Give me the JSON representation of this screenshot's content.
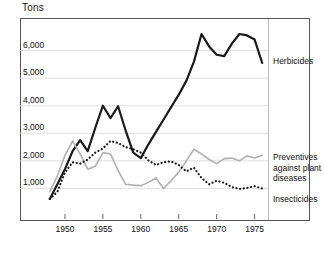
{
  "chart_data": {
    "type": "line",
    "title": "",
    "xlabel": "",
    "ylabel": "Tons",
    "ylim": [
      0,
      7000
    ],
    "xlim": [
      1947.5,
      1976.5
    ],
    "grid": true,
    "grid_axis": "y",
    "legend_position": "right-inline",
    "ytick_labels": [
      "6,000",
      "5,000",
      "4,000",
      "3,000",
      "2,000",
      "1,000"
    ],
    "ytick_values": [
      6000,
      5000,
      4000,
      3000,
      2000,
      1000
    ],
    "xtick_labels": [
      "1950",
      "1955",
      "1960",
      "1965",
      "1970",
      "1975"
    ],
    "xtick_values": [
      1950,
      1955,
      1960,
      1965,
      1970,
      1975
    ],
    "x": [
      1948,
      1949,
      1950,
      1951,
      1952,
      1953,
      1954,
      1955,
      1956,
      1957,
      1958,
      1959,
      1960,
      1961,
      1962,
      1963,
      1964,
      1965,
      1966,
      1967,
      1968,
      1969,
      1970,
      1971,
      1972,
      1973,
      1974,
      1975,
      1976
    ],
    "series": [
      {
        "name": "Herbicides",
        "style": "solid",
        "color": "#1a1a1a",
        "width": 2.2,
        "values": [
          620,
          1150,
          1700,
          2350,
          2750,
          2350,
          3200,
          4000,
          3550,
          3980,
          3100,
          2300,
          2100,
          2600,
          3050,
          3500,
          3950,
          4400,
          4900,
          5600,
          6600,
          6150,
          5850,
          5800,
          6250,
          6600,
          6550,
          6400,
          5550
        ]
      },
      {
        "name": "Preventives against plant diseases",
        "style": "solid",
        "color": "#b0b0b0",
        "width": 1.6,
        "values": [
          880,
          1450,
          2200,
          2720,
          2250,
          1700,
          1800,
          2300,
          2250,
          1650,
          1150,
          1120,
          1100,
          1220,
          1380,
          1000,
          1280,
          1600,
          2000,
          2420,
          2250,
          2050,
          1900,
          2080,
          2100,
          2000,
          2180,
          2100,
          2200
        ]
      },
      {
        "name": "Insecticides",
        "style": "dotted",
        "color": "#1a1a1a",
        "width": 2.2,
        "values": [
          620,
          880,
          1580,
          1950,
          1900,
          2050,
          2300,
          2450,
          2720,
          2650,
          2500,
          2420,
          2300,
          2020,
          1850,
          1950,
          1980,
          1850,
          1620,
          1750,
          1380,
          1150,
          1280,
          1200,
          1050,
          980,
          1020,
          1080,
          1000
        ]
      }
    ],
    "annotations": [
      {
        "name": "Herbicides",
        "text": "Herbicides"
      },
      {
        "name": "Preventives against plant diseases",
        "text": "Preventives\nagainst plant\ndiseases"
      },
      {
        "name": "Insecticides",
        "text": "Insecticides"
      }
    ]
  }
}
